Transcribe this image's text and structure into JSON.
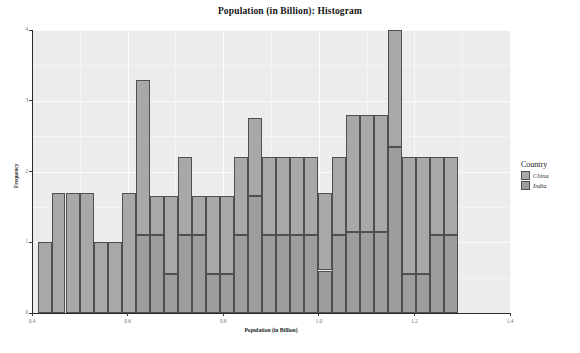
{
  "chart_data": {
    "type": "bar",
    "title": "Population (in Billion): Histogram",
    "xlabel": "Population (in Billion)",
    "ylabel": "Frequency",
    "xlim": [
      0.4,
      1.4
    ],
    "ylim": [
      0,
      4
    ],
    "xticks": [
      "0.4",
      "0.6",
      "0.8",
      "1.0",
      "1.2",
      "1.4"
    ],
    "xtick_values": [
      0.4,
      0.6,
      0.8,
      1.0,
      1.2,
      1.4
    ],
    "yticks": [
      "0",
      "1",
      "2",
      "3",
      "4"
    ],
    "ytick_values": [
      0,
      1,
      2,
      3,
      4
    ],
    "grid": true,
    "stacked": true,
    "bin_width": 0.0295,
    "legend": {
      "title": "Country",
      "position": "right",
      "entries": [
        {
          "name": "China",
          "color": "#a8a8a8"
        },
        {
          "name": "India",
          "color": "#9d9d9d"
        }
      ]
    },
    "bins": [
      {
        "x0": 0.412,
        "x1": 0.441,
        "china": 1,
        "india": 0
      },
      {
        "x0": 0.441,
        "x1": 0.47,
        "china": 1.7,
        "india": 0
      },
      {
        "x0": 0.47,
        "x1": 0.5,
        "china": 1.7,
        "india": 0
      },
      {
        "x0": 0.5,
        "x1": 0.529,
        "china": 1.7,
        "india": 0
      },
      {
        "x0": 0.529,
        "x1": 0.558,
        "china": 1,
        "india": 0
      },
      {
        "x0": 0.558,
        "x1": 0.588,
        "china": 1,
        "india": 0
      },
      {
        "x0": 0.588,
        "x1": 0.617,
        "china": 1.7,
        "india": 0
      },
      {
        "x0": 0.617,
        "x1": 0.646,
        "china": 2.2,
        "india": 1.1
      },
      {
        "x0": 0.646,
        "x1": 0.676,
        "china": 0.55,
        "india": 1.1
      },
      {
        "x0": 0.676,
        "x1": 0.705,
        "china": 1.1,
        "india": 0.55
      },
      {
        "x0": 0.705,
        "x1": 0.734,
        "china": 1.1,
        "india": 1.1
      },
      {
        "x0": 0.734,
        "x1": 0.764,
        "china": 0.55,
        "india": 1.1
      },
      {
        "x0": 0.764,
        "x1": 0.793,
        "china": 1.1,
        "india": 0.55
      },
      {
        "x0": 0.793,
        "x1": 0.822,
        "china": 1.1,
        "india": 0.55
      },
      {
        "x0": 0.822,
        "x1": 0.852,
        "china": 1.1,
        "india": 1.1
      },
      {
        "x0": 0.852,
        "x1": 0.881,
        "china": 1.1,
        "india": 1.65
      },
      {
        "x0": 0.881,
        "x1": 0.91,
        "china": 1.1,
        "india": 1.1
      },
      {
        "x0": 0.91,
        "x1": 0.94,
        "china": 1.1,
        "india": 1.1
      },
      {
        "x0": 0.94,
        "x1": 0.969,
        "china": 1.1,
        "india": 1.1
      },
      {
        "x0": 0.969,
        "x1": 0.998,
        "china": 1.1,
        "india": 1.1
      },
      {
        "x0": 0.998,
        "x1": 1.028,
        "china": 1.1,
        "india": 0.6
      },
      {
        "x0": 1.028,
        "x1": 1.057,
        "china": 1.1,
        "india": 1.1
      },
      {
        "x0": 1.057,
        "x1": 1.086,
        "china": 1.65,
        "india": 1.15
      },
      {
        "x0": 1.086,
        "x1": 1.116,
        "china": 1.65,
        "india": 1.15
      },
      {
        "x0": 1.116,
        "x1": 1.145,
        "china": 1.65,
        "india": 1.15
      },
      {
        "x0": 1.145,
        "x1": 1.174,
        "china": 1.65,
        "india": 2.35
      },
      {
        "x0": 1.174,
        "x1": 1.204,
        "china": 1.65,
        "india": 0.55
      },
      {
        "x0": 1.204,
        "x1": 1.233,
        "china": 1.65,
        "india": 0.55
      },
      {
        "x0": 1.233,
        "x1": 1.262,
        "china": 1.1,
        "india": 1.1
      },
      {
        "x0": 1.262,
        "x1": 1.292,
        "china": 1.1,
        "india": 1.1
      }
    ]
  }
}
